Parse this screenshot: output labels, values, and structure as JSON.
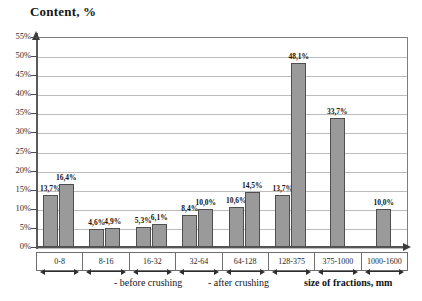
{
  "chart_data": {
    "type": "bar",
    "title": "Content, %",
    "xlabel": "size of fractions, mm",
    "ylabel": "Content, %",
    "ylim": [
      0,
      55
    ],
    "ytick_step": 5,
    "grid": true,
    "legend_position": "bottom",
    "categories": [
      "0-8",
      "8-16",
      "16-32",
      "32-64",
      "64-128",
      "128-375",
      "375-1000",
      "1000-1600"
    ],
    "ytick_labels": [
      "0%",
      "5%",
      "10%",
      "15%",
      "20%",
      "25%",
      "30%",
      "35%",
      "40%",
      "45%",
      "50%",
      "55%"
    ],
    "series": [
      {
        "name": "- before crushing",
        "color": "#9a9a9a",
        "values": [
          13.7,
          4.6,
          5.3,
          8.4,
          10.6,
          13.7,
          null,
          null
        ],
        "labels": [
          "13,7%",
          "4,6%",
          "5,3%",
          "8,4%",
          "10,6%",
          "13,7%",
          "",
          ""
        ]
      },
      {
        "name": "- after crushing",
        "color": "#9a9a9a",
        "values": [
          16.4,
          4.9,
          6.1,
          10.0,
          14.5,
          48.1,
          33.7,
          10.0
        ],
        "labels": [
          "16,4%",
          "4,9%",
          "6,1%",
          "10,0%",
          "14,5%",
          "48,1%",
          "33,7%",
          "10,0%"
        ]
      }
    ]
  }
}
